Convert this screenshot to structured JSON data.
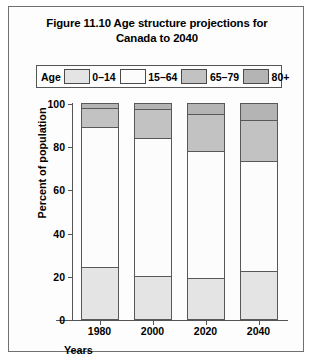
{
  "figure": {
    "title_line1": "Figure 11.10 Age structure projections for",
    "title_line2": "Canada to 2040"
  },
  "legend": {
    "title": "Age",
    "entries": [
      {
        "label": "0–14",
        "color": "#e4e4e4"
      },
      {
        "label": "15–64",
        "color": "#fcfcfc"
      },
      {
        "label": "65–79",
        "color": "#c2c2c2"
      },
      {
        "label": "80+",
        "color": "#b4b4b4"
      }
    ]
  },
  "axes": {
    "y_title": "Percent of population",
    "x_title": "Years",
    "y_ticks": [
      "0",
      "20",
      "40",
      "60",
      "80",
      "100"
    ],
    "x_ticks": [
      "1980",
      "2000",
      "2020",
      "2040"
    ]
  },
  "chart_data": {
    "type": "bar",
    "title": "Figure 11.10 Age structure projections for Canada to 2040",
    "xlabel": "Years",
    "ylabel": "Percent of population",
    "ylim": [
      0,
      100
    ],
    "ytick_step": 20,
    "grid": false,
    "stacked": true,
    "legend_position": "top",
    "legend_title": "Age",
    "categories": [
      "1980",
      "2000",
      "2020",
      "2040"
    ],
    "series": [
      {
        "name": "0–14",
        "color": "#e4e4e4",
        "values": [
          24,
          20,
          19,
          22
        ]
      },
      {
        "name": "15–64",
        "color": "#fcfcfc",
        "values": [
          65,
          64,
          59,
          51
        ]
      },
      {
        "name": "65–79",
        "color": "#c2c2c2",
        "values": [
          8.5,
          13,
          17,
          19
        ]
      },
      {
        "name": "80+",
        "color": "#b4b4b4",
        "values": [
          2.5,
          3,
          5,
          8
        ]
      }
    ],
    "cumulative_tops": {
      "1980": [
        24,
        89,
        97.5,
        100
      ],
      "2000": [
        20,
        84,
        97,
        100
      ],
      "2020": [
        19,
        78,
        95,
        100
      ],
      "2040": [
        22,
        73,
        92,
        100
      ]
    }
  }
}
